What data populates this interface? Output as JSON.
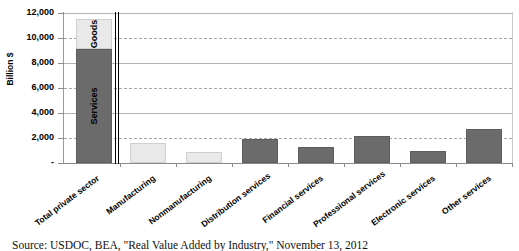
{
  "chart_data": {
    "type": "bar",
    "title": "",
    "subtitle": "",
    "xlabel": "",
    "ylabel": "Billion $",
    "ylim": [
      0,
      12000
    ],
    "grid": true,
    "legend_position": "none",
    "stacked_first_bar": true,
    "categories": [
      "Total private sector",
      "Manufacturing",
      "Nonmanufacturing",
      "Distribution services",
      "Financial services",
      "Professional services",
      "Electronic services",
      "Other services"
    ],
    "ytick_labels": [
      "12,000",
      "10,000",
      "8,000",
      "6,000",
      "4,000",
      "2,000",
      "-"
    ],
    "ytick_values": [
      12000,
      10000,
      8000,
      6000,
      4000,
      2000,
      0
    ],
    "series": [
      {
        "name": "Services",
        "color": "#6b6b6b",
        "values": [
          9150,
          null,
          null,
          null,
          null,
          null,
          null,
          null
        ]
      },
      {
        "name": "Goods",
        "color": "#e9e9e9",
        "values": [
          2350,
          null,
          null,
          null,
          null,
          null,
          null,
          null
        ]
      }
    ],
    "bars": [
      {
        "category": "Total private sector",
        "total": 11500,
        "stacked": true,
        "segments": [
          {
            "label": "Services",
            "value": 9150,
            "color": "#6b6b6b",
            "shade": "dark"
          },
          {
            "label": "Goods",
            "value": 2350,
            "color": "#e9e9e9",
            "shade": "light"
          }
        ]
      },
      {
        "category": "Manufacturing",
        "total": 1600,
        "shade": "light"
      },
      {
        "category": "Nonmanufacturing",
        "total": 900,
        "shade": "light"
      },
      {
        "category": "Distribution services",
        "total": 1950,
        "shade": "dark"
      },
      {
        "category": "Financial services",
        "total": 1300,
        "shade": "dark"
      },
      {
        "category": "Professional services",
        "total": 2150,
        "shade": "dark"
      },
      {
        "category": "Electronic services",
        "total": 950,
        "shade": "dark"
      },
      {
        "category": "Other services",
        "total": 2700,
        "shade": "dark"
      }
    ],
    "annotations": [
      {
        "name": "axis-break",
        "type": "double-vertical-rule",
        "after_category": "Total private sector"
      }
    ]
  },
  "caption": {
    "source_text": "Source: USDOC, BEA, \"Real Value Added by Industry,\" November 13, 2012"
  }
}
